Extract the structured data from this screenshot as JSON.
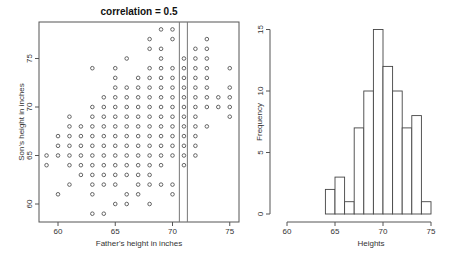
{
  "chart_data": [
    {
      "type": "scatter",
      "title": "correlation = 0.5",
      "xlabel": "Father's height in inches",
      "ylabel": "Son's height in inches",
      "xticks": [
        60,
        65,
        70,
        75
      ],
      "yticks": [
        60,
        65,
        70,
        75
      ],
      "xlim": [
        58.5,
        76
      ],
      "ylim": [
        58.5,
        79
      ],
      "grid": false,
      "vertical_lines": [
        70.6,
        71.3
      ],
      "points_by_son_height": {
        "78": [
          69,
          70
        ],
        "77": [
          68,
          70,
          73
        ],
        "76": [
          68,
          69,
          72,
          73
        ],
        "75": [
          66,
          69,
          71,
          72,
          73
        ],
        "74": [
          63,
          65,
          68,
          69,
          70,
          71,
          72,
          73,
          75
        ],
        "73": [
          65,
          67,
          68,
          69,
          70,
          71,
          72,
          73
        ],
        "72": [
          65,
          66,
          67,
          68,
          69,
          70,
          71,
          72,
          73,
          75
        ],
        "71": [
          64,
          65,
          66,
          67,
          68,
          69,
          70,
          71,
          72,
          73,
          74,
          75
        ],
        "70": [
          63,
          64,
          65,
          66,
          67,
          68,
          69,
          70,
          71,
          72,
          73,
          74,
          75
        ],
        "69": [
          61,
          63,
          64,
          65,
          66,
          67,
          68,
          69,
          70,
          71,
          72,
          75
        ],
        "68": [
          61,
          62,
          63,
          64,
          65,
          66,
          67,
          68,
          69,
          70,
          71,
          72,
          73
        ],
        "67": [
          60,
          61,
          62,
          63,
          64,
          65,
          66,
          67,
          68,
          69,
          70,
          71,
          72
        ],
        "66": [
          60,
          61,
          62,
          63,
          64,
          65,
          66,
          67,
          68,
          69,
          70,
          71,
          72
        ],
        "65": [
          59,
          60,
          61,
          62,
          63,
          64,
          65,
          66,
          67,
          68,
          69,
          70,
          71,
          72
        ],
        "64": [
          59,
          61,
          62,
          63,
          64,
          65,
          66,
          67,
          68,
          69,
          71
        ],
        "63": [
          62,
          63,
          64,
          65,
          66,
          67,
          68
        ],
        "62": [
          61,
          63,
          64,
          65,
          67,
          68,
          69,
          70
        ],
        "61": [
          60,
          63,
          66,
          67,
          70
        ],
        "60": [
          65,
          66,
          68
        ],
        "59": [
          63,
          64
        ]
      }
    },
    {
      "type": "bar",
      "title": "",
      "xlabel": "Heights",
      "ylabel": "Frequency",
      "xticks": [
        60,
        65,
        70,
        75
      ],
      "yticks": [
        0,
        5,
        10,
        15
      ],
      "bin_edges": [
        64,
        65,
        66,
        67,
        68,
        69,
        70,
        71,
        72,
        73,
        74,
        75
      ],
      "categories": [
        "64-65",
        "65-66",
        "66-67",
        "67-68",
        "68-69",
        "69-70",
        "70-71",
        "71-72",
        "72-73",
        "73-74",
        "74-75"
      ],
      "values": [
        2,
        3,
        1,
        7,
        10,
        15,
        12,
        10,
        7,
        8,
        1
      ],
      "xlim": [
        60,
        75
      ],
      "ylim": [
        0,
        15
      ],
      "grid": false
    }
  ],
  "scatter": {
    "title": "correlation = 0.5",
    "xlabel": "Father's height in inches",
    "ylabel": "Son's height in inches",
    "xtick_labels": [
      "60",
      "65",
      "70",
      "75"
    ],
    "ytick_labels": [
      "60",
      "65",
      "70",
      "75"
    ]
  },
  "histogram": {
    "xlabel": "Heights",
    "ylabel": "Frequency",
    "xtick_labels": [
      "60",
      "65",
      "70",
      "75"
    ],
    "ytick_labels": [
      "0",
      "5",
      "10",
      "15"
    ]
  }
}
